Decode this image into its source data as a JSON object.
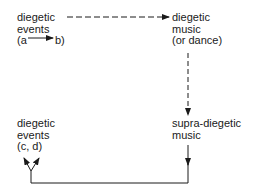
{
  "diagram": {
    "nodes": {
      "diegetic_events_ab": {
        "line1": "diegetic",
        "line2": "events",
        "line3_open": "(a",
        "line3_close": "b)"
      },
      "diegetic_music": {
        "line1": "diegetic",
        "line2": "music",
        "line3": "(or dance)"
      },
      "supra_diegetic_music": {
        "line1": "supra-diegetic",
        "line2": "music"
      },
      "diegetic_events_cd": {
        "line1": "diegetic",
        "line2": "events",
        "line3": "(c, d)"
      }
    },
    "edges": [
      {
        "from": "a",
        "to": "b",
        "style": "solid",
        "note": "inline arrow within node"
      },
      {
        "from": "diegetic_events_ab",
        "to": "diegetic_music",
        "style": "dashed"
      },
      {
        "from": "diegetic_music",
        "to": "supra_diegetic_music",
        "style": "dashed"
      },
      {
        "from": "supra_diegetic_music",
        "to": "diegetic_events_cd",
        "style": "solid",
        "note": "routed down, left, then up splitting into two arrows"
      }
    ],
    "colors": {
      "ink": "#1a1a1a",
      "background": "#ffffff"
    }
  }
}
